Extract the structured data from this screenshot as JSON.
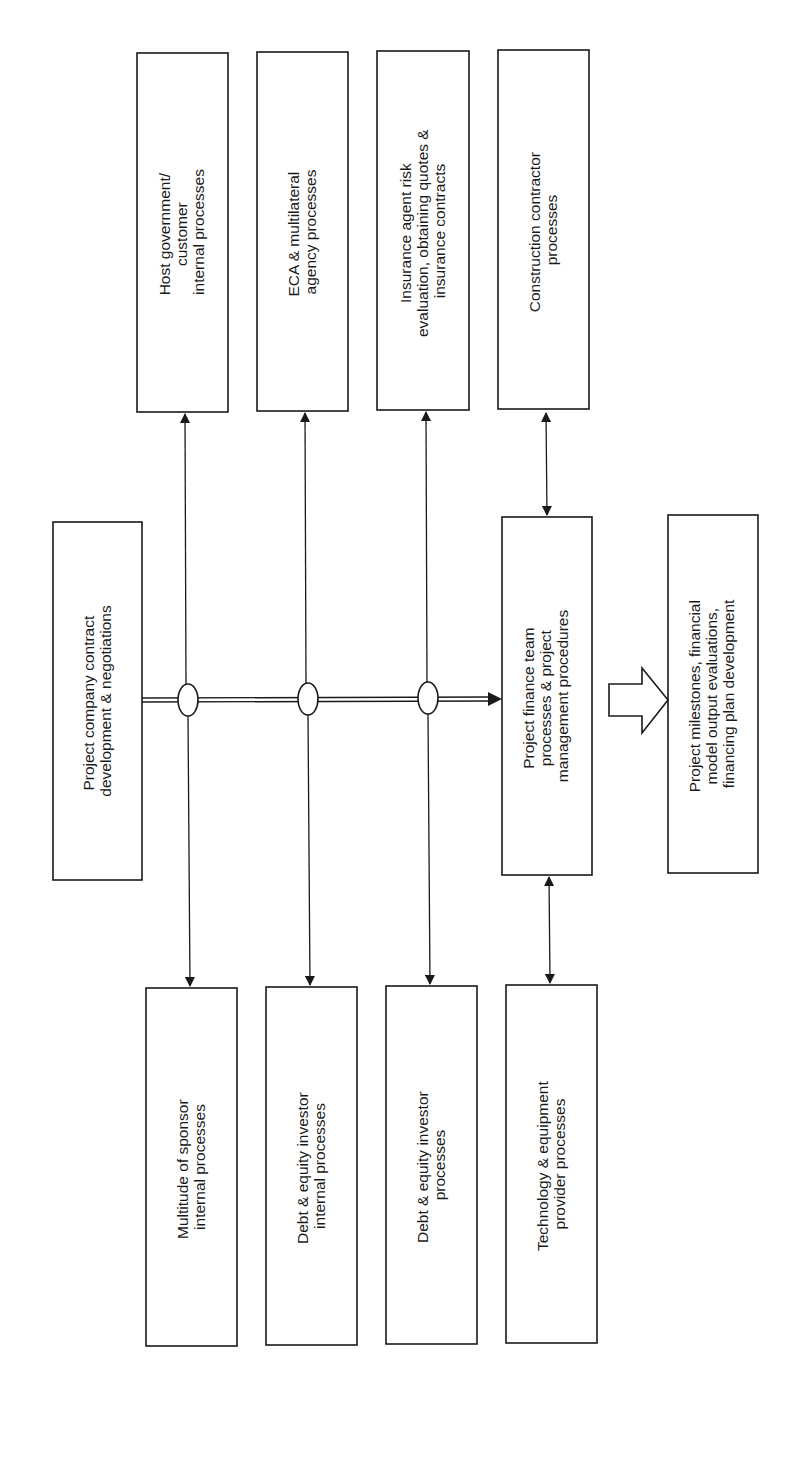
{
  "diagram": {
    "orientation": "rotated-90-ccw",
    "colors": {
      "stroke": "#1a1a1a",
      "fill": "#ffffff",
      "background": "#ffffff"
    },
    "central": {
      "source": {
        "lines": [
          "Project company contract",
          "development & negotiations"
        ]
      },
      "target": {
        "lines": [
          "Project finance team",
          "processes & project",
          "management procedures"
        ]
      },
      "output": {
        "lines": [
          "Project milestones, financial",
          "model output evaluations,",
          "financing plan development"
        ]
      }
    },
    "top_boxes": [
      {
        "lines": [
          "Host government/",
          "customer",
          "internal processes"
        ]
      },
      {
        "lines": [
          "ECA & multilateral",
          "agency processes"
        ]
      },
      {
        "lines": [
          "Insurance agent risk",
          "evaluation, obtaining quotes &",
          "insurance contracts"
        ]
      },
      {
        "lines": [
          "Construction contractor",
          "processes"
        ]
      }
    ],
    "bottom_boxes": [
      {
        "lines": [
          "Multitude of sponsor",
          "internal processes"
        ]
      },
      {
        "lines": [
          "Debt & equity investor",
          "internal processes"
        ]
      },
      {
        "lines": [
          "Debt & equity investor",
          "processes"
        ]
      },
      {
        "lines": [
          "Technology & equipment",
          "provider processes"
        ]
      }
    ],
    "connections": [
      {
        "from": "source",
        "to": "target",
        "style": "double-line-arrow",
        "junctions": 3
      },
      {
        "from": "junction-1",
        "to": "top_boxes.0",
        "style": "arrow"
      },
      {
        "from": "junction-1",
        "to": "bottom_boxes.0",
        "style": "arrow"
      },
      {
        "from": "junction-2",
        "to": "top_boxes.1",
        "style": "arrow"
      },
      {
        "from": "junction-2",
        "to": "bottom_boxes.1",
        "style": "arrow"
      },
      {
        "from": "junction-3",
        "to": "top_boxes.2",
        "style": "arrow"
      },
      {
        "from": "junction-3",
        "to": "bottom_boxes.2",
        "style": "arrow"
      },
      {
        "from": "target",
        "to": "top_boxes.3",
        "style": "double-headed-arrow"
      },
      {
        "from": "target",
        "to": "bottom_boxes.3",
        "style": "double-headed-arrow"
      },
      {
        "from": "target",
        "to": "output",
        "style": "block-arrow"
      }
    ]
  }
}
